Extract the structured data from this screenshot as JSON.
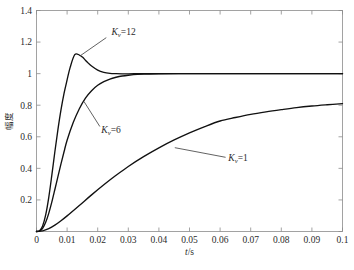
{
  "chart_data": {
    "type": "line",
    "title": "",
    "xlabel": "t/s",
    "ylabel": "幅度",
    "xlim": [
      0,
      0.1
    ],
    "ylim": [
      0,
      1.4
    ],
    "grid": false,
    "legend_position": "inline-annotations",
    "xticks": [
      "0",
      "0.01",
      "0.02",
      "0.03",
      "0.04",
      "0.05",
      "0.06",
      "0.07",
      "0.08",
      "0.09",
      "0.1"
    ],
    "xtick_values": [
      0,
      0.01,
      0.02,
      0.03,
      0.04,
      0.05,
      0.06,
      0.07,
      0.08,
      0.09,
      0.1
    ],
    "yticks": [
      "0",
      "0.2",
      "0.4",
      "0.6",
      "0.8",
      "1",
      "1.2",
      "1.4"
    ],
    "ytick_values": [
      0,
      0.2,
      0.4,
      0.6,
      0.8,
      1,
      1.2,
      1.4
    ],
    "ytick_labels_shown": [
      "0.2",
      "0.4",
      "0.6",
      "0.8",
      "1",
      "1.2",
      "1.4"
    ],
    "series": [
      {
        "name": "Kv=12",
        "label_prefix": "K",
        "label_sub": "v",
        "label_suffix": "=12",
        "color": "#111111",
        "peak_value": 1.12,
        "peak_time": 0.0125,
        "steady_state": 1.0,
        "x": [
          0,
          0.001,
          0.002,
          0.003,
          0.004,
          0.005,
          0.006,
          0.007,
          0.008,
          0.009,
          0.01,
          0.011,
          0.0125,
          0.014,
          0.015,
          0.016,
          0.017,
          0.018,
          0.02,
          0.022,
          0.024,
          0.026,
          0.028,
          0.03,
          0.033,
          0.036,
          0.04,
          0.05,
          0.06,
          0.07,
          0.08,
          0.09,
          0.1
        ],
        "y": [
          0,
          0.005,
          0.035,
          0.105,
          0.215,
          0.355,
          0.505,
          0.645,
          0.77,
          0.875,
          0.96,
          1.04,
          1.12,
          1.118,
          1.105,
          1.085,
          1.065,
          1.048,
          1.022,
          1.008,
          1.002,
          1.0,
          0.999,
          0.999,
          1.0,
          1.0,
          1.0,
          1.0,
          1.0,
          1.0,
          1.0,
          1.0,
          1.0
        ]
      },
      {
        "name": "Kv=6",
        "label_prefix": "K",
        "label_sub": "v",
        "label_suffix": "=6",
        "color": "#111111",
        "peak_value": 1.0,
        "steady_state": 1.0,
        "x": [
          0,
          0.001,
          0.002,
          0.003,
          0.004,
          0.005,
          0.006,
          0.007,
          0.008,
          0.009,
          0.01,
          0.012,
          0.014,
          0.016,
          0.018,
          0.02,
          0.022,
          0.024,
          0.026,
          0.028,
          0.03,
          0.033,
          0.036,
          0.04,
          0.05,
          0.06,
          0.07,
          0.08,
          0.09,
          0.1
        ],
        "y": [
          0,
          0.003,
          0.02,
          0.058,
          0.115,
          0.186,
          0.266,
          0.348,
          0.428,
          0.505,
          0.578,
          0.69,
          0.778,
          0.845,
          0.892,
          0.926,
          0.949,
          0.966,
          0.977,
          0.985,
          0.99,
          0.995,
          0.997,
          0.999,
          1.0,
          1.0,
          1.0,
          1.0,
          1.0,
          1.0
        ]
      },
      {
        "name": "Kv=1",
        "label_prefix": "K",
        "label_sub": "v",
        "label_suffix": "=1",
        "color": "#111111",
        "value_at_end": 0.81,
        "steady_state": 1.0,
        "x": [
          0,
          0.002,
          0.004,
          0.006,
          0.008,
          0.01,
          0.014,
          0.018,
          0.022,
          0.026,
          0.03,
          0.035,
          0.04,
          0.045,
          0.05,
          0.055,
          0.06,
          0.065,
          0.07,
          0.075,
          0.08,
          0.085,
          0.09,
          0.095,
          0.1
        ],
        "y": [
          0,
          0.004,
          0.018,
          0.04,
          0.068,
          0.099,
          0.165,
          0.232,
          0.296,
          0.356,
          0.412,
          0.474,
          0.53,
          0.58,
          0.625,
          0.665,
          0.7,
          0.722,
          0.742,
          0.758,
          0.772,
          0.785,
          0.795,
          0.803,
          0.81
        ]
      }
    ],
    "annotations": [
      {
        "id": "ann-kv12",
        "text_prefix": "K",
        "text_sub": "v",
        "text_suffix": "=12",
        "text_x": 0.0245,
        "text_y": 1.245,
        "leader_from": [
          0.0228,
          1.228
        ],
        "leader_to": [
          0.0142,
          1.112
        ]
      },
      {
        "id": "ann-kv6",
        "text_prefix": "K",
        "text_sub": "v",
        "text_suffix": "=6",
        "text_x": 0.0212,
        "text_y": 0.625,
        "leader_from": [
          0.0207,
          0.665
        ],
        "leader_to": [
          0.0155,
          0.824
        ]
      },
      {
        "id": "ann-kv1",
        "text_prefix": "K",
        "text_sub": "v",
        "text_suffix": "=1",
        "text_x": 0.0627,
        "text_y": 0.448,
        "leader_from": [
          0.0618,
          0.47
        ],
        "leader_to": [
          0.0452,
          0.531
        ]
      }
    ]
  }
}
